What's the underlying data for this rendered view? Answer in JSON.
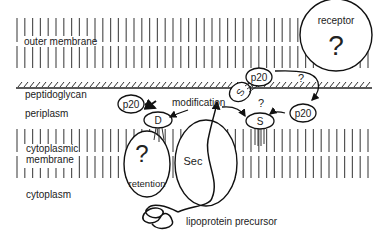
{
  "diagram": {
    "regions": {
      "outer_membrane": "outer membrane",
      "peptidoglycan": "peptidoglycan",
      "periplasm": "periplasm",
      "cytoplasmic_membrane_line1": "cytoplasmic",
      "cytoplasmic_membrane_line2": "membrane",
      "cytoplasm": "cytoplasm"
    },
    "nodes": {
      "receptor_label": "receptor",
      "receptor_question": "?",
      "retention_label": "retention",
      "retention_question": "?",
      "sec_label": "Sec",
      "p20_left": "p20",
      "p20_top": "p20",
      "p20_right": "p20",
      "d_protein": "D",
      "s_protein_anchored": "S",
      "s_protein_inner": "S",
      "question_upper": "?",
      "question_middle": "?"
    },
    "annotations": {
      "modification": "modification",
      "lipoprotein_precursor": "lipoprotein precursor"
    }
  }
}
